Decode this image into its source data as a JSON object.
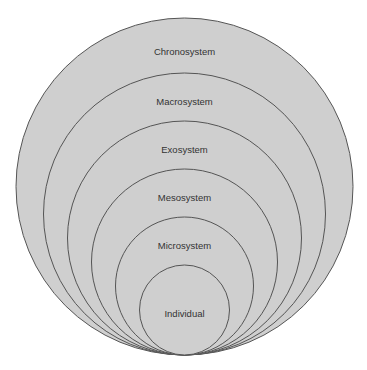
{
  "diagram": {
    "type": "nested-circles",
    "fill_color": "#cfcfcf",
    "stroke_color": "#555555",
    "layers": [
      {
        "label": "Chronosystem",
        "r": 168.5,
        "label_y": 52
      },
      {
        "label": "Macrosystem",
        "r": 141,
        "label_y": 102
      },
      {
        "label": "Exosystem",
        "r": 117,
        "label_y": 150
      },
      {
        "label": "Mesosystem",
        "r": 93,
        "label_y": 198
      },
      {
        "label": "Microsystem",
        "r": 69,
        "label_y": 246
      },
      {
        "label": "Individual",
        "r": 45,
        "label_y": 314
      }
    ]
  }
}
